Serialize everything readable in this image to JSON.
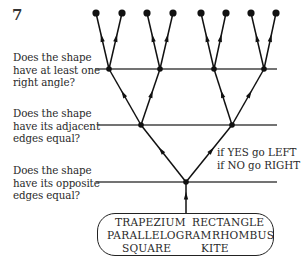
{
  "figure": {
    "number": "7"
  },
  "questions": [
    {
      "id": "right-angle",
      "lines": [
        "Does the shape",
        "have at least one",
        "right angle?"
      ]
    },
    {
      "id": "adjacent-edges",
      "lines": [
        "Does the shape",
        "have its adjacent",
        "edges equal?"
      ]
    },
    {
      "id": "opposite-edges",
      "lines": [
        "Does the shape",
        "have its opposite",
        "edges equal?"
      ]
    }
  ],
  "instruction": {
    "yes": "if YES go LEFT",
    "no": "if NO go RIGHT"
  },
  "shapes": [
    "TRAPEZIUM",
    "RECTANGLE",
    "PARALLELOGRAM",
    "RHOMBUS",
    "SQUARE",
    "KITE"
  ],
  "tree": {
    "levels": 3,
    "leaf_count": 8,
    "branching": "binary",
    "left_branch_meaning": "YES",
    "right_branch_meaning": "NO"
  }
}
